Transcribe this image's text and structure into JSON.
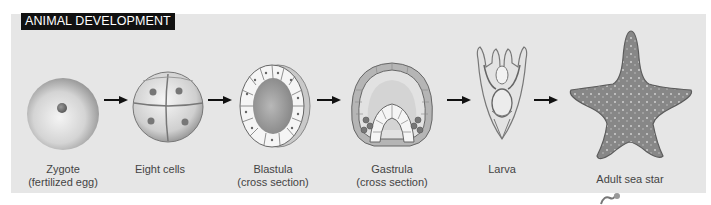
{
  "header": {
    "title": "ANIMAL DEVELOPMENT"
  },
  "colors": {
    "panel_bg": "#e6e6e6",
    "title_bg": "#111111",
    "title_fg": "#ffffff",
    "label_fg": "#444444",
    "arrow": "#111111",
    "sea_star": "#8a8a8a"
  },
  "stages": [
    {
      "id": "zygote",
      "icon": "zygote-icon",
      "label_line1": "Zygote",
      "label_line2": "(fertilized egg)"
    },
    {
      "id": "eight-cells",
      "icon": "eight-cell-embryo-icon",
      "label_line1": "Eight cells",
      "label_line2": ""
    },
    {
      "id": "blastula",
      "icon": "blastula-icon",
      "label_line1": "Blastula",
      "label_line2": "(cross section)"
    },
    {
      "id": "gastrula",
      "icon": "gastrula-icon",
      "label_line1": "Gastrula",
      "label_line2": "(cross section)"
    },
    {
      "id": "larva",
      "icon": "larva-icon",
      "label_line1": "Larva",
      "label_line2": ""
    },
    {
      "id": "adult",
      "icon": "sea-star-icon",
      "label_line1": "Adult sea star",
      "label_line2": ""
    }
  ],
  "arrows": [
    "arrow-right-icon",
    "arrow-right-icon",
    "arrow-right-icon",
    "arrow-right-icon",
    "arrow-right-icon"
  ]
}
